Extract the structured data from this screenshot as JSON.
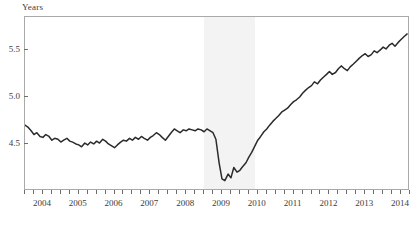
{
  "chart_data": {
    "type": "line",
    "title": "",
    "subtitle": "",
    "xlabel": "",
    "ylabel": "Years",
    "ylim": [
      4.0,
      5.85
    ],
    "xlim": [
      2003.5,
      2014.25
    ],
    "grid": false,
    "legend": null,
    "y_ticks": [
      4.5,
      5.0,
      5.5
    ],
    "y_tick_labels": [
      "4.5",
      "5.0",
      "5.5"
    ],
    "x_ticks": [
      2004,
      2005,
      2006,
      2007,
      2008,
      2009,
      2010,
      2011,
      2012,
      2013,
      2014
    ],
    "x_tick_labels": [
      "2004",
      "2005",
      "2006",
      "2007",
      "2008",
      "2009",
      "2010",
      "2011",
      "2012",
      "2013",
      "2014"
    ],
    "x_minor_tick_interval": 0.25,
    "line_color": "#2b2b2b",
    "line_width": 1.5,
    "shaded_regions": [
      {
        "name": "recession",
        "x_start": 2008.5,
        "x_end": 2009.92,
        "color": "#f3f3f3"
      }
    ],
    "series": [
      {
        "name": "Average duration of unemployment",
        "x": [
          2003.5,
          2003.58,
          2003.67,
          2003.75,
          2003.83,
          2003.92,
          2004.0,
          2004.08,
          2004.17,
          2004.25,
          2004.33,
          2004.42,
          2004.5,
          2004.58,
          2004.67,
          2004.75,
          2004.83,
          2004.92,
          2005.0,
          2005.08,
          2005.17,
          2005.25,
          2005.33,
          2005.42,
          2005.5,
          2005.58,
          2005.67,
          2005.75,
          2005.83,
          2005.92,
          2006.0,
          2006.08,
          2006.17,
          2006.25,
          2006.33,
          2006.42,
          2006.5,
          2006.58,
          2006.67,
          2006.75,
          2006.83,
          2006.92,
          2007.0,
          2007.08,
          2007.17,
          2007.25,
          2007.33,
          2007.42,
          2007.5,
          2007.58,
          2007.67,
          2007.75,
          2007.83,
          2007.92,
          2008.0,
          2008.08,
          2008.17,
          2008.25,
          2008.33,
          2008.42,
          2008.5,
          2008.58,
          2008.67,
          2008.75,
          2008.83,
          2008.92,
          2009.0,
          2009.08,
          2009.17,
          2009.25,
          2009.33,
          2009.42,
          2009.5,
          2009.58,
          2009.67,
          2009.75,
          2009.83,
          2009.92,
          2010.0,
          2010.08,
          2010.17,
          2010.25,
          2010.33,
          2010.42,
          2010.5,
          2010.58,
          2010.67,
          2010.75,
          2010.83,
          2010.92,
          2011.0,
          2011.08,
          2011.17,
          2011.25,
          2011.33,
          2011.42,
          2011.5,
          2011.58,
          2011.67,
          2011.75,
          2011.83,
          2011.92,
          2012.0,
          2012.08,
          2012.17,
          2012.25,
          2012.33,
          2012.42,
          2012.5,
          2012.58,
          2012.67,
          2012.75,
          2012.83,
          2012.92,
          2013.0,
          2013.08,
          2013.17,
          2013.25,
          2013.33,
          2013.42,
          2013.5,
          2013.58,
          2013.67,
          2013.75,
          2013.83,
          2013.92,
          2014.0,
          2014.08,
          2014.17
        ],
        "values": [
          4.7,
          4.68,
          4.64,
          4.6,
          4.62,
          4.58,
          4.57,
          4.6,
          4.58,
          4.54,
          4.56,
          4.55,
          4.52,
          4.54,
          4.56,
          4.53,
          4.52,
          4.5,
          4.49,
          4.47,
          4.51,
          4.49,
          4.52,
          4.5,
          4.53,
          4.51,
          4.55,
          4.53,
          4.5,
          4.48,
          4.46,
          4.49,
          4.52,
          4.54,
          4.53,
          4.56,
          4.54,
          4.57,
          4.55,
          4.58,
          4.56,
          4.54,
          4.57,
          4.59,
          4.62,
          4.6,
          4.57,
          4.54,
          4.58,
          4.62,
          4.66,
          4.64,
          4.62,
          4.65,
          4.64,
          4.66,
          4.65,
          4.64,
          4.66,
          4.65,
          4.63,
          4.66,
          4.64,
          4.62,
          4.55,
          4.3,
          4.13,
          4.11,
          4.18,
          4.14,
          4.25,
          4.2,
          4.22,
          4.26,
          4.3,
          4.36,
          4.41,
          4.48,
          4.54,
          4.58,
          4.63,
          4.66,
          4.7,
          4.74,
          4.77,
          4.8,
          4.84,
          4.86,
          4.88,
          4.92,
          4.95,
          4.97,
          5.0,
          5.04,
          5.07,
          5.1,
          5.12,
          5.16,
          5.14,
          5.18,
          5.21,
          5.24,
          5.27,
          5.24,
          5.26,
          5.3,
          5.33,
          5.3,
          5.28,
          5.32,
          5.35,
          5.38,
          5.41,
          5.44,
          5.46,
          5.43,
          5.45,
          5.49,
          5.47,
          5.5,
          5.53,
          5.51,
          5.55,
          5.57,
          5.54,
          5.58,
          5.61,
          5.64,
          5.67
        ]
      }
    ]
  },
  "labels": {
    "y_axis_title": "Years"
  }
}
